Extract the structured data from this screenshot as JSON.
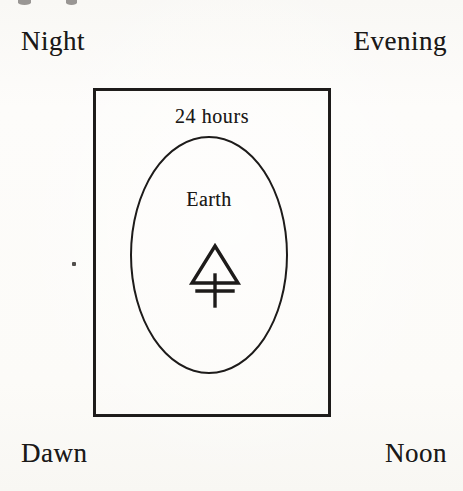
{
  "figure": {
    "kind": "earth-rotation-diagram",
    "medium": "scanned engraving",
    "ink_color": "#1d1b1a",
    "paper_color": "#fbfaf8"
  },
  "corner_labels": {
    "top_left": "Night",
    "top_right": "Evening",
    "bottom_left": "Dawn",
    "bottom_right": "Noon"
  },
  "inner_labels": {
    "period": "24 hours",
    "body": "Earth"
  },
  "symbol": {
    "name": "earth-symbol",
    "description": "triangle above a cross"
  },
  "artifacts": {
    "speck": "",
    "top_cut_a": "",
    "top_cut_b": ""
  }
}
